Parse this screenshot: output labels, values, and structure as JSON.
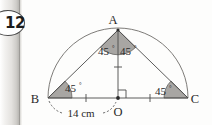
{
  "question": {
    "number": "12"
  },
  "figure": {
    "type": "geometry-diagram",
    "points": [
      {
        "name": "A",
        "label": "A",
        "x": 118,
        "y": 30,
        "label_x": 113,
        "label_y": 24
      },
      {
        "name": "B",
        "label": "B",
        "x": 48,
        "y": 98,
        "label_x": 33,
        "label_y": 103
      },
      {
        "name": "C",
        "label": "C",
        "x": 188,
        "y": 98,
        "label_x": 193,
        "label_y": 103
      },
      {
        "name": "O",
        "label": "O",
        "x": 118,
        "y": 98,
        "label_x": 114,
        "label_y": 114
      }
    ],
    "angles": [
      {
        "at": "A",
        "side": "left",
        "value": "45",
        "degree": "°",
        "label_x": 97,
        "label_y": 52
      },
      {
        "at": "A",
        "side": "right",
        "value": "45",
        "degree": "°",
        "label_x": 120,
        "label_y": 52
      },
      {
        "at": "B",
        "side": "",
        "value": "45",
        "degree": "°",
        "label_x": 62,
        "label_y": 90
      },
      {
        "at": "C",
        "side": "",
        "value": "45",
        "degree": "°",
        "label_x": 158,
        "label_y": 93
      },
      {
        "at": "O",
        "side": "",
        "value": "",
        "degree": "",
        "label_x": 0,
        "label_y": 0
      }
    ],
    "measurements": [
      {
        "segment": "BO",
        "label": "14 cm",
        "label_x": 62,
        "label_y": 117
      }
    ],
    "marks": {
      "right_angle_at": "O",
      "tick_segments": [
        "BO",
        "OC",
        "AO"
      ]
    }
  },
  "colors": {
    "stroke": "#4a4a4a",
    "arc_stroke": "#6e6c69",
    "angle_fill": "#a8a6a3",
    "text": "#2a2a2a",
    "background": "#fdfdfc",
    "badge_border": "#4a4a4a"
  }
}
